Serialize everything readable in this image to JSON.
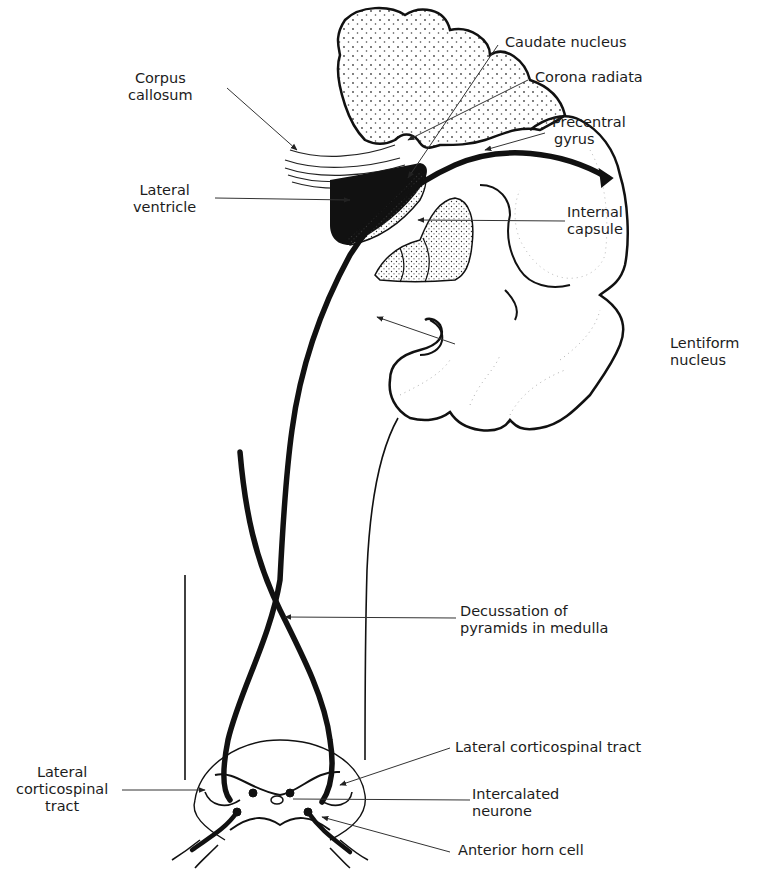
{
  "figure": {
    "labels": {
      "caudate_nucleus": "Caudate nucleus",
      "corona_radiata": "Corona radiata",
      "corpus_callosum_1": "Corpus",
      "corpus_callosum_2": "callosum",
      "precentral_gyrus_1": "Precentral",
      "precentral_gyrus_2": "gyrus",
      "lateral_ventricle_1": "Lateral",
      "lateral_ventricle_2": "ventricle",
      "internal_capsule_1": "Internal",
      "internal_capsule_2": "capsule",
      "lentiform_nucleus_1": "Lentiform",
      "lentiform_nucleus_2": "nucleus",
      "decussation_1": "Decussation of",
      "decussation_2": "pyramids in medulla",
      "lateral_cst_right": "Lateral corticospinal tract",
      "lateral_cst_left_1": "Lateral",
      "lateral_cst_left_2": "corticospinal",
      "lateral_cst_left_3": "tract",
      "intercalated_1": "Intercalated",
      "intercalated_2": "neurone",
      "anterior_horn_cell": "Anterior horn cell"
    },
    "colors": {
      "ink": "#111111",
      "stipple": "#555555",
      "background": "#ffffff"
    }
  }
}
